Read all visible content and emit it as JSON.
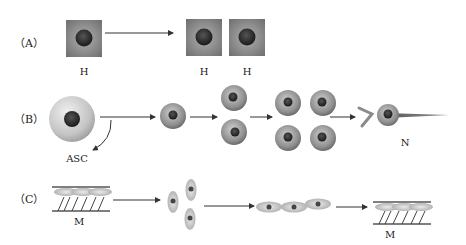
{
  "panels": {
    "A": {
      "label": "（A）",
      "cells": [
        {
          "type": "square-cell",
          "label": "H"
        },
        {
          "type": "square-cell",
          "label": "H"
        },
        {
          "type": "square-cell",
          "label": "H"
        }
      ]
    },
    "B": {
      "label": "（B）",
      "start_label": "ASC",
      "end_label": "N",
      "stages": [
        "stem-cell",
        "single-cell",
        "two-cells",
        "four-cells",
        "neuron"
      ]
    },
    "C": {
      "label": "（C）",
      "start_label": "M",
      "end_label": "M",
      "stages": [
        "myofiber",
        "spindle-cells",
        "aligned-cells",
        "myofiber"
      ]
    }
  },
  "colors": {
    "background": "#ffffff",
    "cell_gray": "#9a9a9a",
    "nucleus": "#2a2a2a",
    "arrow": "#333333"
  }
}
